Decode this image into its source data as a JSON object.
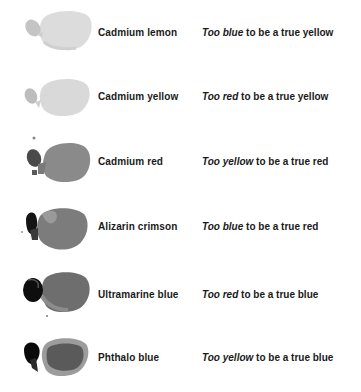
{
  "rows": [
    {
      "name": "Cadmium lemon",
      "desc_emph": "Too blue",
      "desc_rest": " to be a true yellow",
      "swatch": {
        "body": "#dcdcdc",
        "head": "#c4c4c4",
        "shade": "#d2d2d2"
      }
    },
    {
      "name": "Cadmium yellow",
      "desc_emph": "Too red",
      "desc_rest": " to be a true yellow",
      "swatch": {
        "body": "#d9d9d9",
        "head": "#bdbdbd",
        "shade": "#cfcfcf"
      }
    },
    {
      "name": "Cadmium red",
      "desc_emph": "Too yellow",
      "desc_rest": " to be a true red",
      "swatch": {
        "body": "#8a8a8a",
        "head": "#4a4a4a",
        "shade": "#7a7a7a"
      }
    },
    {
      "name": "Alizarin crimson",
      "desc_emph": "Too blue",
      "desc_rest": " to be a true red",
      "swatch": {
        "body": "#7c7c7c",
        "head": "#141414",
        "shade": "#9a9a9a"
      }
    },
    {
      "name": "Ultramarine blue",
      "desc_emph": "Too red",
      "desc_rest": " to be a true blue",
      "swatch": {
        "body": "#6e6e6e",
        "head": "#0e0e0e",
        "shade": "#8c8c8c"
      }
    },
    {
      "name": "Phthalo blue",
      "desc_emph": "Too yellow",
      "desc_rest": " to be a true blue",
      "swatch": {
        "body": "#5a5a5a",
        "head": "#0a0a0a",
        "shade": "#9c9c9c"
      }
    }
  ]
}
